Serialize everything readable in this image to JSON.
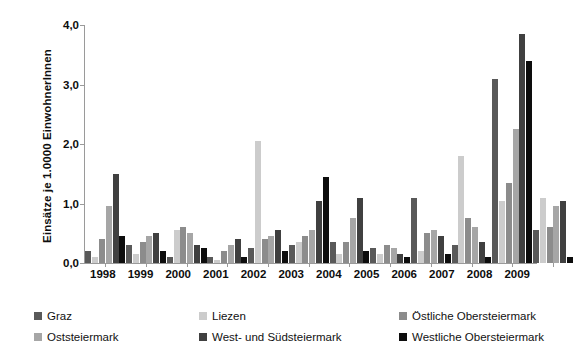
{
  "chart_data": {
    "type": "bar",
    "title": "",
    "xlabel": "",
    "ylabel": "Einsätze je 1.0000 EinwohnerInnen",
    "ylim": [
      0,
      4.0
    ],
    "ytick_labels": [
      "4,0",
      "3,0",
      "2,0",
      "1,0",
      "0,0"
    ],
    "ytick_values": [
      4.0,
      3.0,
      2.0,
      1.0,
      0.0
    ],
    "grid": false,
    "legend_position": "bottom",
    "categories": [
      "1998",
      "1999",
      "2000",
      "2001",
      "2002",
      "2003",
      "2004",
      "2005",
      "2006",
      "2007",
      "2008",
      "2009"
    ],
    "series": [
      {
        "name": "Graz",
        "color": "#595959",
        "values": [
          0.2,
          0.3,
          0.1,
          0.1,
          0.25,
          0.3,
          0.35,
          0.25,
          1.1,
          0.3,
          3.1,
          0.55
        ]
      },
      {
        "name": "Liezen",
        "color": "#cccccc",
        "values": [
          0.1,
          0.15,
          0.55,
          0.05,
          2.05,
          0.35,
          0.15,
          0.15,
          0.2,
          1.8,
          1.05,
          1.1
        ]
      },
      {
        "name": "Östliche Obersteiermark",
        "color": "#8c8c8c",
        "values": [
          0.4,
          0.35,
          0.6,
          0.2,
          0.4,
          0.45,
          0.35,
          0.3,
          0.5,
          0.75,
          1.35,
          0.6
        ]
      },
      {
        "name": "Oststeiermark",
        "color": "#a6a6a6",
        "values": [
          0.95,
          0.45,
          0.5,
          0.3,
          0.45,
          0.55,
          0.75,
          0.25,
          0.55,
          0.6,
          2.25,
          0.95
        ]
      },
      {
        "name": "West- und Südsteiermark",
        "color": "#404040",
        "values": [
          1.5,
          0.5,
          0.3,
          0.4,
          0.55,
          1.05,
          1.1,
          0.15,
          0.45,
          0.35,
          3.85,
          1.05
        ]
      },
      {
        "name": "Westliche Obersteiermark",
        "color": "#0d0d0d",
        "values": [
          0.45,
          0.2,
          0.25,
          0.1,
          0.2,
          1.45,
          0.2,
          0.1,
          0.15,
          0.1,
          3.4,
          0.1
        ]
      }
    ]
  }
}
